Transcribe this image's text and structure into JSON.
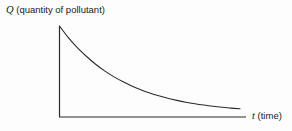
{
  "figure": {
    "background_color": "#fdfdfd",
    "line_color": "#2b2b2b",
    "y_axis": {
      "symbol": "Q",
      "description": "(quantity of pollutant)"
    },
    "x_axis": {
      "symbol": "t",
      "description": "(time)"
    }
  },
  "chart_data": {
    "type": "line",
    "title": "",
    "subtitle": "",
    "xlabel": "t (time)",
    "ylabel": "Q (quantity of pollutant)",
    "xlim": [
      0,
      1
    ],
    "ylim": [
      0,
      1
    ],
    "grid": false,
    "legend": "none",
    "tick_labels": {
      "x": [],
      "y": []
    },
    "annotations": [],
    "series": [
      {
        "name": "exponential decay of pollutant",
        "x": [
          0.0,
          0.05,
          0.1,
          0.15,
          0.2,
          0.25,
          0.3,
          0.35,
          0.4,
          0.45,
          0.5,
          0.55,
          0.6,
          0.65,
          0.7,
          0.75,
          0.8,
          0.85,
          0.9,
          0.95,
          1.0
        ],
        "y": [
          1.0,
          0.87,
          0.76,
          0.665,
          0.58,
          0.507,
          0.444,
          0.389,
          0.341,
          0.3,
          0.264,
          0.233,
          0.206,
          0.183,
          0.163,
          0.146,
          0.131,
          0.118,
          0.107,
          0.098,
          0.09
        ]
      }
    ]
  }
}
